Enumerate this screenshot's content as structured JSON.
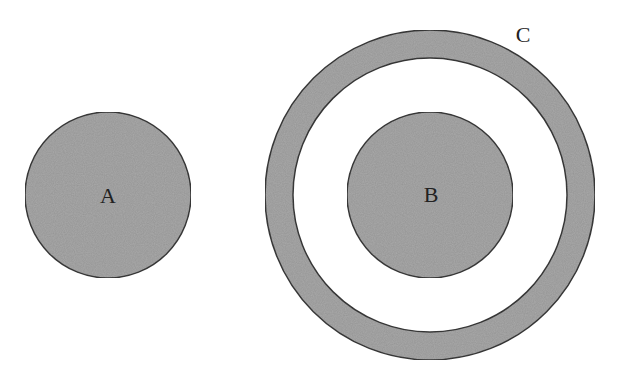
{
  "diagram": {
    "colors": {
      "fill": "#a9a9a9",
      "stroke": "#3a3a3a",
      "background": "#ffffff"
    },
    "shapes": [
      {
        "id": "A",
        "type": "circle",
        "label": "A",
        "cx": 108,
        "cy": 195,
        "r": 83
      },
      {
        "id": "C",
        "type": "ring",
        "label": "C",
        "cx": 430,
        "cy": 195,
        "r_outer": 165,
        "r_inner": 137
      },
      {
        "id": "B",
        "type": "circle",
        "label": "B",
        "cx": 430,
        "cy": 195,
        "r": 83
      }
    ],
    "labels": {
      "a": "A",
      "b": "B",
      "c": "C"
    }
  }
}
